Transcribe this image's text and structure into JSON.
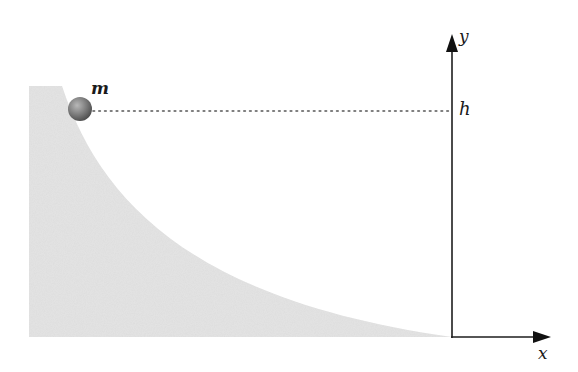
{
  "diagram": {
    "type": "physics-diagram",
    "labels": {
      "mass": "m",
      "height": "h",
      "y_axis": "y",
      "x_axis": "x"
    },
    "colors": {
      "ramp_fill": "#e4e4e4",
      "ball": "#7a7a7a",
      "axis": "#1e1e1e",
      "dotted_line": "#555555"
    }
  }
}
